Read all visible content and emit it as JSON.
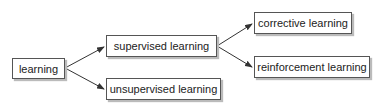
{
  "nodes": {
    "learning": "learning",
    "supervised": "supervised learning",
    "unsupervised": "unsupervised learning",
    "corrective": "corrective learning",
    "reinforcement": "reinforcement learning"
  },
  "edges": [
    {
      "from": "learning",
      "to": "supervised learning"
    },
    {
      "from": "learning",
      "to": "unsupervised learning"
    },
    {
      "from": "supervised learning",
      "to": "corrective learning"
    },
    {
      "from": "supervised learning",
      "to": "reinforcement learning"
    }
  ],
  "colors": {
    "border": "#555555",
    "arrow": "#333333",
    "shadow": "#bbbbbb"
  }
}
